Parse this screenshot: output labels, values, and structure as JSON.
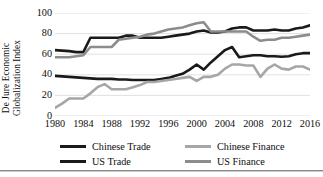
{
  "chart_data": {
    "type": "line",
    "title": "",
    "xlabel": "",
    "ylabel": "De Jure Economic Globalization Index",
    "ylabel_line1": "De Jure Economic",
    "ylabel_line2": "Globalization Index",
    "xlim": [
      1980,
      2016
    ],
    "ylim": [
      0,
      100
    ],
    "grid": "horizontal",
    "legend_position": "bottom",
    "yticks": [
      0,
      20,
      40,
      60,
      80,
      100
    ],
    "xticks": [
      1980,
      1984,
      1988,
      1992,
      1996,
      2000,
      2004,
      2008,
      2012,
      2016
    ],
    "x": [
      1980,
      1981,
      1982,
      1983,
      1984,
      1985,
      1986,
      1987,
      1988,
      1989,
      1990,
      1991,
      1992,
      1993,
      1994,
      1995,
      1996,
      1997,
      1998,
      1999,
      2000,
      2001,
      2002,
      2003,
      2004,
      2005,
      2006,
      2007,
      2008,
      2009,
      2010,
      2011,
      2012,
      2013,
      2014,
      2015,
      2016
    ],
    "series": [
      {
        "name": "Chinese Trade",
        "color": "#1a1a1a",
        "width": 2.6,
        "values": [
          39,
          38.5,
          38,
          37.5,
          37,
          36.5,
          36,
          36,
          36,
          35.5,
          35.5,
          35,
          35,
          35,
          35,
          36,
          37,
          39,
          41,
          45,
          50,
          45,
          52,
          58,
          64,
          67,
          57,
          58,
          59,
          59,
          58,
          58,
          57.5,
          58,
          60,
          61,
          61
        ]
      },
      {
        "name": "Chinese Finance",
        "color": "#a6a6a6",
        "width": 2.6,
        "values": [
          8,
          12,
          17,
          17,
          17,
          22,
          28,
          31,
          26,
          26,
          26,
          28,
          30,
          33,
          33,
          34,
          35,
          36,
          37,
          38,
          34,
          38,
          38,
          40,
          46,
          50,
          50,
          49,
          49,
          38,
          46,
          50,
          46,
          45,
          48,
          48,
          45
        ]
      },
      {
        "name": "US Trade",
        "color": "#1a1a1a",
        "width": 2.6,
        "values": [
          64,
          63.5,
          63,
          62,
          62,
          76,
          76,
          76,
          76,
          76,
          78,
          78,
          76,
          76,
          76,
          76,
          77,
          78,
          79,
          80,
          82,
          83,
          81,
          81,
          82,
          85,
          86,
          86,
          83,
          83,
          83,
          84,
          83,
          83,
          85,
          86,
          88
        ]
      },
      {
        "name": "US Finance",
        "color": "#8c8c8c",
        "width": 2.6,
        "values": [
          57,
          57,
          57,
          58,
          59,
          67,
          67,
          67,
          67,
          74,
          75,
          76,
          77,
          79,
          80,
          82,
          84,
          85,
          86,
          88,
          90,
          91,
          82,
          82,
          82,
          82,
          82,
          82,
          77,
          73,
          74,
          74,
          76,
          76,
          77,
          78,
          79
        ]
      }
    ]
  },
  "legend": {
    "items": [
      {
        "label": "Chinese Trade",
        "color": "#1a1a1a"
      },
      {
        "label": "Chinese Finance",
        "color": "#a6a6a6"
      },
      {
        "label": "US Trade",
        "color": "#1a1a1a"
      },
      {
        "label": "US Finance",
        "color": "#8c8c8c"
      }
    ]
  },
  "style": {
    "gridline_color": "#d9d9d9",
    "text_color": "#0d0d0d",
    "background": "#ffffff"
  }
}
